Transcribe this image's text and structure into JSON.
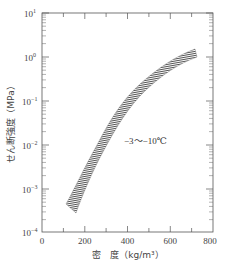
{
  "chart_data": {
    "type": "area",
    "title": "",
    "xlabel": "密　度（kg/m³）",
    "ylabel": "せん断強度（MPa）",
    "xlim": [
      0,
      800
    ],
    "ylim": [
      0.0001,
      10
    ],
    "yscale": "log",
    "grid": false,
    "x_ticks": [
      "0",
      "200",
      "400",
      "600",
      "800"
    ],
    "y_ticks": [
      "10^-4",
      "10^-3",
      "10^-2",
      "10^-1",
      "10^0",
      "10^1"
    ],
    "series": [
      {
        "name": "-3~-10℃ band (upper bound)",
        "x": [
          130,
          200,
          300,
          400,
          500,
          600,
          720
        ],
        "values": [
          0.00045,
          0.002,
          0.02,
          0.1,
          0.35,
          0.75,
          1.4
        ]
      },
      {
        "name": "-3~-10℃ band (lower bound)",
        "x": [
          180,
          250,
          350,
          450,
          550,
          650,
          720
        ],
        "values": [
          0.0003,
          0.0015,
          0.012,
          0.06,
          0.2,
          0.5,
          0.9
        ]
      }
    ],
    "annotations": [
      {
        "text": "−3～−10℃",
        "x": 420,
        "y": 0.01
      }
    ],
    "fill_pattern": "hatched"
  },
  "labels": {
    "xlabel": "密　度（kg/m³）",
    "ylabel": "せん断強度（MPa）",
    "annotation": "−3～−10℃",
    "x_ticks": [
      "0",
      "200",
      "400",
      "600",
      "800"
    ],
    "y_tick_base": "10",
    "y_tick_exps": [
      "1",
      "0",
      "−1",
      "−2",
      "−3",
      "−4"
    ]
  }
}
